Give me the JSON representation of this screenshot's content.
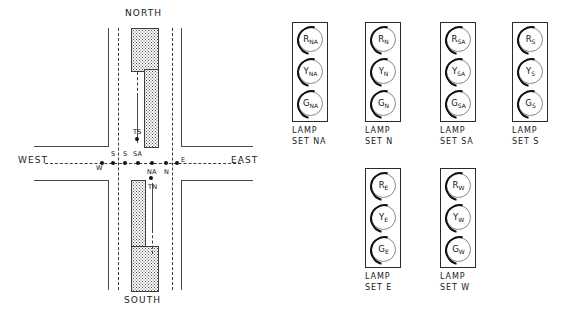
{
  "diagram": {
    "compass": {
      "north": "NORTH",
      "south": "SOUTH",
      "west": "WEST",
      "east": "EAST"
    },
    "detectors": [
      {
        "id": "W",
        "label": "W",
        "x": 102,
        "y": 163,
        "label_x": 96,
        "label_y": 164
      },
      {
        "id": "S1",
        "label": "S",
        "x": 113,
        "y": 163,
        "label_x": 111,
        "label_y": 150
      },
      {
        "id": "S2",
        "label": "S",
        "x": 125,
        "y": 163,
        "label_x": 123,
        "label_y": 150
      },
      {
        "id": "SA",
        "label": "SA",
        "x": 138,
        "y": 163,
        "label_x": 133,
        "label_y": 150
      },
      {
        "id": "NA",
        "label": "NA",
        "x": 152,
        "y": 163,
        "label_x": 147,
        "label_y": 168
      },
      {
        "id": "N",
        "label": "N",
        "x": 166,
        "y": 163,
        "label_x": 164,
        "label_y": 168
      },
      {
        "id": "E",
        "label": "E",
        "x": 177,
        "y": 163,
        "label_x": 181,
        "label_y": 156
      },
      {
        "id": "TS",
        "label": "TS",
        "x": 137,
        "y": 139,
        "label_x": 133,
        "label_y": 128
      },
      {
        "id": "TN",
        "label": "TN",
        "x": 151,
        "y": 178,
        "label_x": 148,
        "label_y": 183
      }
    ]
  },
  "lamp_sets": [
    {
      "id": "NA",
      "caption_line1": "LAMP",
      "caption_line2": "SET NA",
      "x": 292,
      "y": 22,
      "lamps": [
        {
          "role": "red",
          "letter": "R",
          "sub": "NA"
        },
        {
          "role": "yellow",
          "letter": "Y",
          "sub": "NA"
        },
        {
          "role": "green",
          "letter": "G",
          "sub": "NA"
        }
      ]
    },
    {
      "id": "N",
      "caption_line1": "LAMP",
      "caption_line2": "SET N",
      "x": 365,
      "y": 22,
      "lamps": [
        {
          "role": "red",
          "letter": "R",
          "sub": "N"
        },
        {
          "role": "yellow",
          "letter": "Y",
          "sub": "N"
        },
        {
          "role": "green",
          "letter": "G",
          "sub": "N"
        }
      ]
    },
    {
      "id": "SA",
      "caption_line1": "LAMP",
      "caption_line2": "SET SA",
      "x": 440,
      "y": 22,
      "lamps": [
        {
          "role": "red",
          "letter": "R",
          "sub": "SA"
        },
        {
          "role": "yellow",
          "letter": "Y",
          "sub": "SA"
        },
        {
          "role": "green",
          "letter": "G",
          "sub": "SA"
        }
      ]
    },
    {
      "id": "S",
      "caption_line1": "LAMP",
      "caption_line2": "SET S",
      "x": 512,
      "y": 22,
      "lamps": [
        {
          "role": "red",
          "letter": "R",
          "sub": "S"
        },
        {
          "role": "yellow",
          "letter": "Y",
          "sub": "S"
        },
        {
          "role": "green",
          "letter": "G",
          "sub": "S"
        }
      ]
    },
    {
      "id": "E",
      "caption_line1": "LAMP",
      "caption_line2": "SET E",
      "x": 365,
      "y": 168,
      "lamps": [
        {
          "role": "red",
          "letter": "R",
          "sub": "E"
        },
        {
          "role": "yellow",
          "letter": "Y",
          "sub": "E"
        },
        {
          "role": "green",
          "letter": "G",
          "sub": "E"
        }
      ]
    },
    {
      "id": "W",
      "caption_line1": "LAMP",
      "caption_line2": "SET W",
      "x": 440,
      "y": 168,
      "lamps": [
        {
          "role": "red",
          "letter": "R",
          "sub": "W"
        },
        {
          "role": "yellow",
          "letter": "Y",
          "sub": "W"
        },
        {
          "role": "green",
          "letter": "G",
          "sub": "W"
        }
      ]
    }
  ],
  "colors": {
    "stroke": "#2a2a2a",
    "text": "#111111",
    "median_fill": "#4d4d4d",
    "background": "#ffffff"
  }
}
